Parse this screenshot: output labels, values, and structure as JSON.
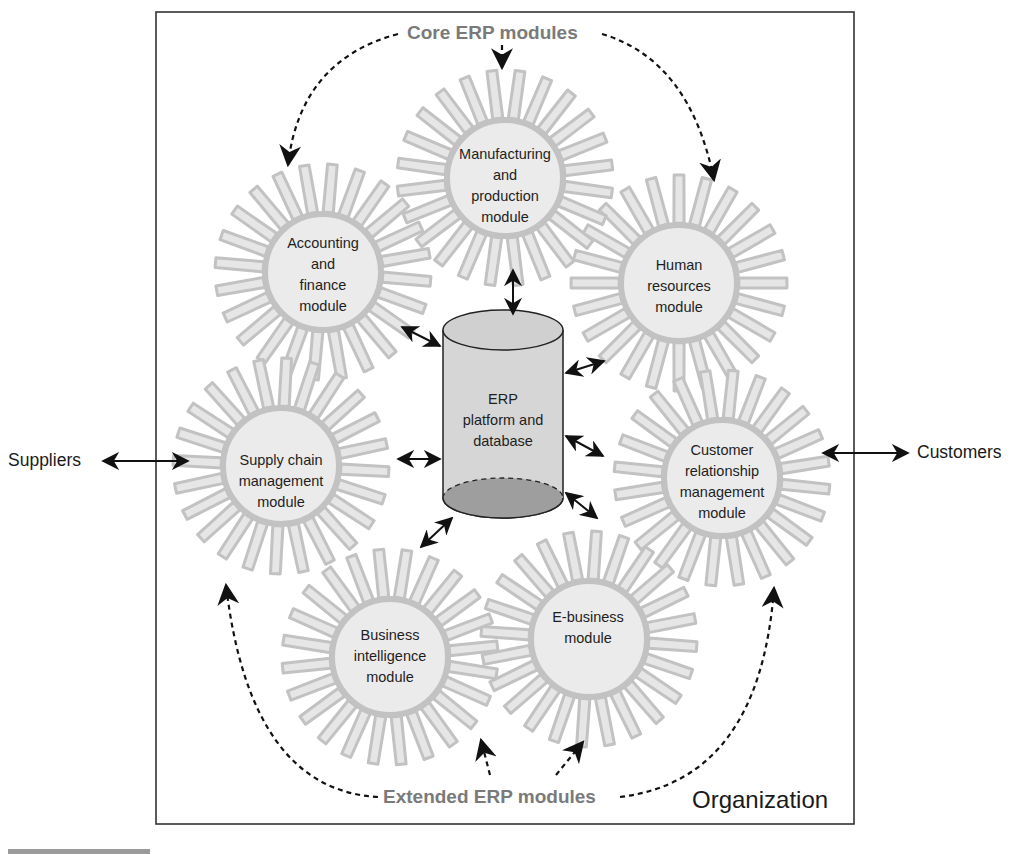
{
  "diagram": {
    "container_label": "Organization",
    "group_labels": {
      "core": "Core ERP modules",
      "extended": "Extended ERP modules"
    },
    "external_entities": {
      "left": "Suppliers",
      "right": "Customers"
    },
    "center": {
      "lines": [
        "ERP",
        "platform and",
        "database"
      ],
      "shape": "cylinder-database"
    },
    "modules": [
      {
        "id": "manufacturing",
        "group": "core",
        "lines": [
          "Manufacturing",
          "and",
          "production",
          "module"
        ]
      },
      {
        "id": "accounting",
        "group": "core",
        "lines": [
          "Accounting",
          "and",
          "finance",
          "module"
        ]
      },
      {
        "id": "human-resources",
        "group": "core",
        "lines": [
          "Human",
          "resources",
          "module"
        ]
      },
      {
        "id": "supply-chain",
        "group": "extended",
        "lines": [
          "Supply chain",
          "management",
          "module"
        ]
      },
      {
        "id": "crm",
        "group": "extended",
        "lines": [
          "Customer",
          "relationship",
          "management",
          "module"
        ]
      },
      {
        "id": "business-intelligence",
        "group": "extended",
        "lines": [
          "Business",
          "intelligence",
          "module"
        ]
      },
      {
        "id": "e-business",
        "group": "extended",
        "lines": [
          "E-business",
          "module"
        ]
      }
    ],
    "connections": [
      {
        "from": "Suppliers",
        "to": "supply-chain",
        "style": "solid-bidirectional"
      },
      {
        "from": "crm",
        "to": "Customers",
        "style": "solid-bidirectional"
      },
      {
        "from": "center",
        "to": "manufacturing",
        "style": "solid-bidirectional"
      },
      {
        "from": "center",
        "to": "accounting",
        "style": "solid-bidirectional"
      },
      {
        "from": "center",
        "to": "human-resources",
        "style": "solid-bidirectional"
      },
      {
        "from": "center",
        "to": "supply-chain",
        "style": "solid-bidirectional"
      },
      {
        "from": "center",
        "to": "crm",
        "style": "solid-bidirectional"
      },
      {
        "from": "center",
        "to": "business-intelligence",
        "style": "solid-bidirectional"
      },
      {
        "from": "center",
        "to": "e-business",
        "style": "solid-bidirectional"
      },
      {
        "from": "Core ERP modules",
        "to": "manufacturing",
        "style": "dashed"
      },
      {
        "from": "Core ERP modules",
        "to": "accounting",
        "style": "dashed"
      },
      {
        "from": "Core ERP modules",
        "to": "human-resources",
        "style": "dashed"
      },
      {
        "from": "Extended ERP modules",
        "to": "supply-chain",
        "style": "dashed"
      },
      {
        "from": "Extended ERP modules",
        "to": "business-intelligence",
        "style": "dashed"
      },
      {
        "from": "Extended ERP modules",
        "to": "e-business",
        "style": "dashed"
      },
      {
        "from": "Extended ERP modules",
        "to": "crm",
        "style": "dashed"
      }
    ],
    "colors": {
      "gear_fill": "#e6e6e6",
      "gear_stroke": "#c2c2c2",
      "cylinder_body": "#d4d4d4",
      "cylinder_bottom": "#9c9c9c",
      "group_label": "#7a7a7a",
      "line": "#111111"
    }
  }
}
